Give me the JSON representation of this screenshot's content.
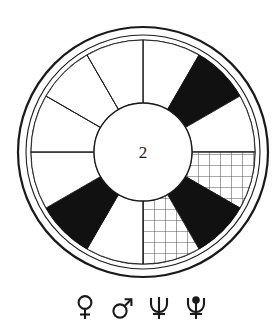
{
  "figure": {
    "center_label": "2",
    "colors": {
      "stroke": "#1a1a1a",
      "fill_solid": "#111111",
      "fill_empty": "#ffffff",
      "hatch_stroke": "#555555"
    },
    "geometry": {
      "center_x": 143,
      "center_y": 152,
      "outer_ring_outer_radius": 125,
      "outer_ring_inner_radius": 117,
      "annulus_outer_radius": 112,
      "annulus_inner_radius": 49,
      "sector_count": 12,
      "sector_degrees": 30
    },
    "sectors": [
      {
        "index": 0,
        "start_deg": 0,
        "end_deg": 30,
        "fill": "empty"
      },
      {
        "index": 1,
        "start_deg": 30,
        "end_deg": 60,
        "fill": "solid"
      },
      {
        "index": 2,
        "start_deg": 60,
        "end_deg": 90,
        "fill": "empty"
      },
      {
        "index": 3,
        "start_deg": 90,
        "end_deg": 120,
        "fill": "grid"
      },
      {
        "index": 4,
        "start_deg": 120,
        "end_deg": 150,
        "fill": "solid"
      },
      {
        "index": 5,
        "start_deg": 150,
        "end_deg": 180,
        "fill": "grid"
      },
      {
        "index": 6,
        "start_deg": 180,
        "end_deg": 210,
        "fill": "empty"
      },
      {
        "index": 7,
        "start_deg": 210,
        "end_deg": 240,
        "fill": "solid"
      },
      {
        "index": 8,
        "start_deg": 240,
        "end_deg": 270,
        "fill": "empty"
      },
      {
        "index": 9,
        "start_deg": 270,
        "end_deg": 300,
        "fill": "empty"
      },
      {
        "index": 10,
        "start_deg": 300,
        "end_deg": 330,
        "fill": "empty"
      },
      {
        "index": 11,
        "start_deg": 330,
        "end_deg": 360,
        "fill": "empty"
      }
    ]
  },
  "legend": {
    "symbols": [
      {
        "name": "venus-symbol",
        "glyph": "♀",
        "label": "Venus"
      },
      {
        "name": "mars-symbol",
        "glyph": "♂",
        "label": "Mars"
      },
      {
        "name": "neptune-symbol",
        "glyph": "♆",
        "label": "Neptune"
      },
      {
        "name": "pluto-symbol",
        "glyph": "♇",
        "label": "Pluto"
      }
    ]
  }
}
